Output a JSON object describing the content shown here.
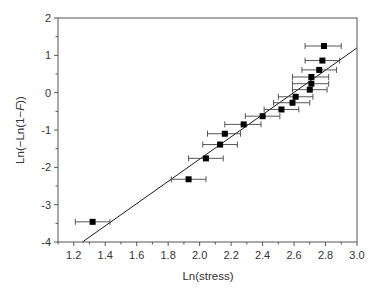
{
  "chart_data": {
    "type": "scatter",
    "title": "",
    "xlabel": "Ln(stress)",
    "ylabel": "Ln(−Ln(1−F))",
    "ylabel_parts": [
      "Ln(−Ln(1−",
      "F",
      "))"
    ],
    "xlim": [
      1.1,
      3.0
    ],
    "ylim": [
      -4,
      2
    ],
    "x_ticks": [
      1.2,
      1.4,
      1.6,
      1.8,
      2.0,
      2.2,
      2.4,
      2.6,
      2.8,
      3.0
    ],
    "x_tick_labels": [
      "1.2",
      "1.4",
      "1.6",
      "1.8",
      "2.0",
      "2.2",
      "2.4",
      "2.6",
      "2.8",
      "3.0"
    ],
    "x_minor_ticks": [
      1.1,
      1.3,
      1.5,
      1.7,
      1.9,
      2.1,
      2.3,
      2.5,
      2.7,
      2.9
    ],
    "y_ticks": [
      -4,
      -3,
      -2,
      -1,
      0,
      1,
      2
    ],
    "y_tick_labels": [
      "-4",
      "-3",
      "-2",
      "-1",
      "0",
      "1",
      "2"
    ],
    "y_minor_ticks": [
      -3.5,
      -2.5,
      -1.5,
      -0.5,
      0.5,
      1.5
    ],
    "grid": false,
    "legend": null,
    "series": [
      {
        "name": "data",
        "marker": "square",
        "color": "#000000",
        "points": [
          {
            "x": 1.32,
            "y": -3.46,
            "xerr_low": 1.21,
            "xerr_high": 1.43
          },
          {
            "x": 1.93,
            "y": -2.32,
            "xerr_low": 1.82,
            "xerr_high": 2.04
          },
          {
            "x": 2.04,
            "y": -1.76,
            "xerr_low": 1.93,
            "xerr_high": 2.15
          },
          {
            "x": 2.13,
            "y": -1.39,
            "xerr_low": 2.02,
            "xerr_high": 2.24
          },
          {
            "x": 2.16,
            "y": -1.1,
            "xerr_low": 2.05,
            "xerr_high": 2.26
          },
          {
            "x": 2.28,
            "y": -0.85,
            "xerr_low": 2.16,
            "xerr_high": 2.39
          },
          {
            "x": 2.4,
            "y": -0.63,
            "xerr_low": 2.29,
            "xerr_high": 2.51
          },
          {
            "x": 2.52,
            "y": -0.45,
            "xerr_low": 2.41,
            "xerr_high": 2.63
          },
          {
            "x": 2.59,
            "y": -0.27,
            "xerr_low": 2.47,
            "xerr_high": 2.7
          },
          {
            "x": 2.61,
            "y": -0.11,
            "xerr_low": 2.5,
            "xerr_high": 2.72
          },
          {
            "x": 2.7,
            "y": 0.08,
            "xerr_low": 2.59,
            "xerr_high": 2.81
          },
          {
            "x": 2.71,
            "y": 0.24,
            "xerr_low": 2.59,
            "xerr_high": 2.82
          },
          {
            "x": 2.71,
            "y": 0.42,
            "xerr_low": 2.59,
            "xerr_high": 2.82
          },
          {
            "x": 2.76,
            "y": 0.61,
            "xerr_low": 2.65,
            "xerr_high": 2.87
          },
          {
            "x": 2.78,
            "y": 0.86,
            "xerr_low": 2.67,
            "xerr_high": 2.89
          },
          {
            "x": 2.79,
            "y": 1.25,
            "xerr_low": 2.67,
            "xerr_high": 2.9
          }
        ]
      }
    ],
    "fit_line": {
      "name": "linear fit",
      "x1": 1.255,
      "y1": -4.0,
      "x2": 3.0,
      "y2": 1.2,
      "color": "#000000"
    }
  }
}
